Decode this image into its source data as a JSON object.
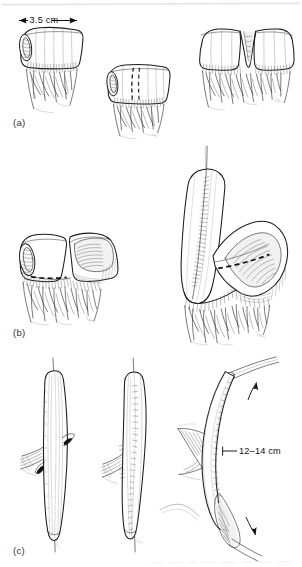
{
  "figure": {
    "kind": "surgical-technique-line-drawing",
    "background_color": "#ffffff",
    "ink_color": "#1b1b1b",
    "panels": [
      {
        "id": "a",
        "label": "(a)",
        "annotations": [
          {
            "name": "segment-width-dimension",
            "text": "3.5 cm"
          }
        ],
        "steps": [
          {
            "name": "isolated-bowel-segment-with-mesentery"
          },
          {
            "name": "segment-with-dashed-incision-line"
          },
          {
            "name": "segment-opened-into-v-shape"
          }
        ]
      },
      {
        "id": "b",
        "label": "(b)",
        "annotations": [],
        "steps": [
          {
            "name": "two-limbs-with-dashed-anastomosis-line"
          },
          {
            "name": "limbs-folded-with-dashed-suture-line"
          }
        ]
      },
      {
        "id": "c",
        "label": "(c)",
        "annotations": [
          {
            "name": "tube-length-dimension",
            "text": "12–14 cm"
          }
        ],
        "steps": [
          {
            "name": "tubularized-segment-anterior-view"
          },
          {
            "name": "tubularized-segment-sutured-view"
          },
          {
            "name": "completed-conduit-with-catheter"
          }
        ]
      }
    ]
  },
  "labels": {
    "panel_a": "(a)",
    "panel_b": "(b)",
    "panel_c": "(c)",
    "dim_width": "3.5 cm",
    "dim_length": "12–14 cm"
  }
}
